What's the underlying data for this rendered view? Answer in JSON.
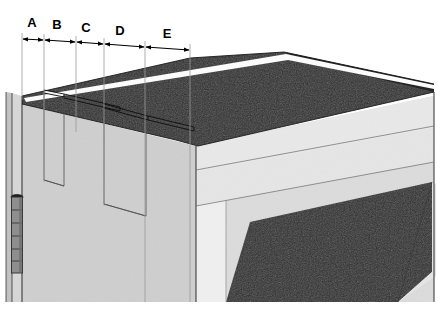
{
  "figure": {
    "type": "technical-line-drawing",
    "view": "perspective-isometric",
    "background_color": "#ffffff"
  },
  "palette": {
    "dark_surface": "#2b2b2b",
    "dark_surface_shadow": "#1d1d1d",
    "light_face": "#d0d0d0",
    "light_face_bright": "#e3e3e3",
    "light_face_mid": "#c6c6c6",
    "white_stripe": "#fbfbfb",
    "outline": "#1a1a1a",
    "hidden_line": "#5a5a5a",
    "hinge_body": "#8e8e8e",
    "hinge_outline": "#303030",
    "label_color": "#000000"
  },
  "dimensions": {
    "axis_note": "dimension chain runs along the top front edge, left to right, slightly descending",
    "labels": [
      {
        "id": "A",
        "label": "A",
        "label_x": 32,
        "label_y": 27,
        "start_x": 22,
        "end_x": 44,
        "start_y": 39,
        "end_y": 40
      },
      {
        "id": "B",
        "label": "B",
        "label_x": 57,
        "label_y": 29,
        "start_x": 44,
        "end_x": 76,
        "start_y": 40,
        "end_y": 42
      },
      {
        "id": "C",
        "label": "C",
        "label_x": 86,
        "label_y": 31,
        "start_x": 76,
        "end_x": 104,
        "start_y": 42,
        "end_y": 44
      },
      {
        "id": "D",
        "label": "D",
        "label_x": 120,
        "label_y": 34,
        "start_x": 104,
        "end_x": 145,
        "start_y": 44,
        "end_y": 47
      },
      {
        "id": "E",
        "label": "E",
        "label_x": 167,
        "label_y": 37,
        "start_x": 145,
        "end_x": 190,
        "start_y": 47,
        "end_y": 50
      }
    ],
    "extension_lines": [
      {
        "x_top": 22,
        "y_top": 33,
        "x_bottom": 22,
        "y_bottom": 104
      },
      {
        "x_top": 44,
        "y_top": 34,
        "x_bottom": 44,
        "y_bottom": 108
      },
      {
        "x_top": 76,
        "y_top": 36,
        "x_bottom": 76,
        "y_bottom": 132
      },
      {
        "x_top": 104,
        "y_top": 38,
        "x_bottom": 104,
        "y_bottom": 186
      },
      {
        "x_top": 145,
        "y_top": 41,
        "x_bottom": 145,
        "y_bottom": 300
      },
      {
        "x_top": 190,
        "y_top": 44,
        "x_bottom": 190,
        "y_bottom": 300
      }
    ]
  },
  "geometry": {
    "top_surface": {
      "name": "dark-top-panel",
      "fill": "#2b2b2b",
      "points": "22,96 190,58 278,52 432,86 432,92 196,145 176,140 22,104"
    },
    "top_surface_main": {
      "name": "dark-top-panel-main",
      "points": "60,92 282,50 434,84 434,96 200,146 60,104"
    },
    "white_stripe_top": {
      "name": "white-highlight-stripe",
      "points": "24,98 284,54 434,86 434,90 286,60 26,102"
    },
    "front_left_face": {
      "name": "light-front-left-face",
      "fill": "#d0d0d0",
      "points": "22,104 196,146 196,300 22,300"
    },
    "right_side_face": {
      "name": "light-right-side-face",
      "fill": "#dcdcdc",
      "points": "196,146 434,96 434,300 196,300"
    },
    "diagonal_band": {
      "name": "diagonal-light-band",
      "points": "196,172 434,130 434,166 196,208"
    },
    "lower_dark_step": {
      "name": "dark-lower-step-panel",
      "fill": "#2b2b2b",
      "points": "222,300 246,222 430,186 430,278 400,300"
    },
    "slots": [
      {
        "name": "slot-1",
        "points": "40,88 40,182 60,190 60,96",
        "hidden": true
      },
      {
        "name": "slot-2",
        "points": "60,96 110,110 110,112 60,98",
        "hidden": true
      },
      {
        "name": "slot-3",
        "points": "100,108 100,204 142,216 142,118",
        "hidden": true
      },
      {
        "name": "slot-4",
        "points": "142,118 186,130 186,132 142,120",
        "hidden": true
      }
    ],
    "hinge": {
      "name": "door-hinge",
      "x": 12,
      "y": 196,
      "width": 10,
      "height": 78,
      "segments": 6,
      "fill": "#8e8e8e"
    },
    "door_edge_lines": [
      {
        "x1": 10,
        "y1": 92,
        "x2": 10,
        "y2": 300
      },
      {
        "x1": 17,
        "y1": 94,
        "x2": 17,
        "y2": 300
      },
      {
        "x1": 22,
        "y1": 96,
        "x2": 22,
        "y2": 300
      }
    ]
  },
  "labels_order": [
    "A",
    "B",
    "C",
    "D",
    "E"
  ]
}
